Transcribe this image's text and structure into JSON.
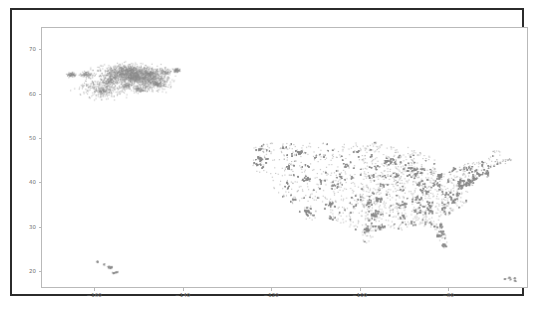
{
  "figure": {
    "background_color": "#ffffff",
    "frame_color": "#2b2b2b",
    "axes_spine_color": "#b9b9b9",
    "tick_label_color": "#6f6f6f"
  },
  "chart_data": {
    "type": "scatter",
    "title": "",
    "xlabel": "",
    "ylabel": "",
    "xlim": [
      -172,
      -62
    ],
    "ylim": [
      16.2,
      75.0
    ],
    "xticks": [
      -160,
      -140,
      -120,
      -100,
      -80
    ],
    "xtick_labels": [
      "−160",
      "−140",
      "−120",
      "−100",
      "−80"
    ],
    "yticks": [
      20,
      30,
      40,
      50,
      60,
      70
    ],
    "ytick_labels": [
      "20",
      "30",
      "40",
      "50",
      "60",
      "70"
    ],
    "grid": false,
    "legend": null,
    "marker": {
      "color": "#8a8a8a",
      "size_px": 1.1,
      "alpha": 0.55,
      "shape": "circle"
    },
    "series": [
      {
        "name": "locations",
        "description": "Geographic point locations across the United States (longitude vs latitude)",
        "point_count_approx": 22000,
        "clusters": [
          {
            "name": "alaska",
            "lon_range": [
              -167.5,
              -141.0
            ],
            "lat_range": [
              56.5,
              71.3
            ],
            "weight": 0.09,
            "core_lon_range": [
              -162.0,
              -142.0
            ],
            "core_lat_range": [
              60.5,
              68.5
            ]
          },
          {
            "name": "continental-us",
            "lon_range": [
              -124.7,
              -67.0
            ],
            "lat_range": [
              25.3,
              49.3
            ],
            "weight": 0.88,
            "core_lon_range": [
              -123.0,
              -70.0
            ],
            "core_lat_range": [
              30.0,
              48.5
            ]
          },
          {
            "name": "hawaii",
            "lon_range": [
              -160.3,
              -154.8
            ],
            "lat_range": [
              18.9,
              22.3
            ],
            "weight": 0.015
          },
          {
            "name": "caribbean-territories",
            "lon_range": [
              -67.3,
              -64.6
            ],
            "lat_range": [
              17.6,
              18.5
            ],
            "weight": 0.008
          },
          {
            "name": "northeast-outliers",
            "lon_range": [
              -70.0,
              -66.0
            ],
            "lat_range": [
              43.0,
              45.5
            ],
            "weight": 0.007
          }
        ]
      }
    ]
  }
}
